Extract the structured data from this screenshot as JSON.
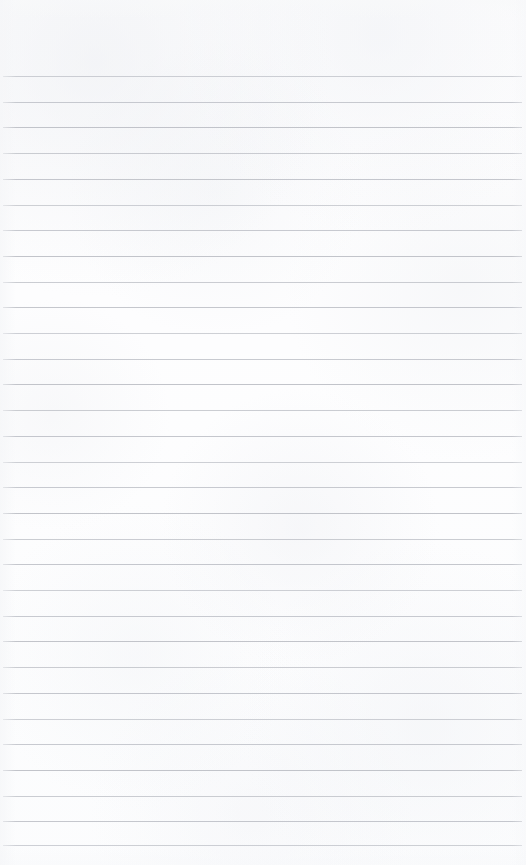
{
  "page": {
    "kind": "ruled-notebook-paper",
    "title": "",
    "content_text": "",
    "width_px": 526,
    "height_px": 865,
    "background_color": "#fdfdfe",
    "paper_tone": "off-white"
  },
  "ruling": {
    "line_color": "#b9bcc3",
    "line_thickness_px": 1,
    "line_spacing_px": 25.7,
    "first_line_y_px": 76,
    "line_left_x_px": 3,
    "line_right_x_px": 522,
    "line_count": 31,
    "top_margin_px": 76,
    "bottom_margin_px": 20,
    "has_vertical_margin_rule": false,
    "lines_y": [
      76,
      101.7,
      127.4,
      153.1,
      178.8,
      204.5,
      230.2,
      255.9,
      281.6,
      307.3,
      333.0,
      358.7,
      384.4,
      410.1,
      435.8,
      461.5,
      487.2,
      512.9,
      538.6,
      564.3,
      590.0,
      615.7,
      641.4,
      667.1,
      692.8,
      718.5,
      744.2,
      769.9,
      795.6,
      821.3,
      845.0
    ]
  }
}
